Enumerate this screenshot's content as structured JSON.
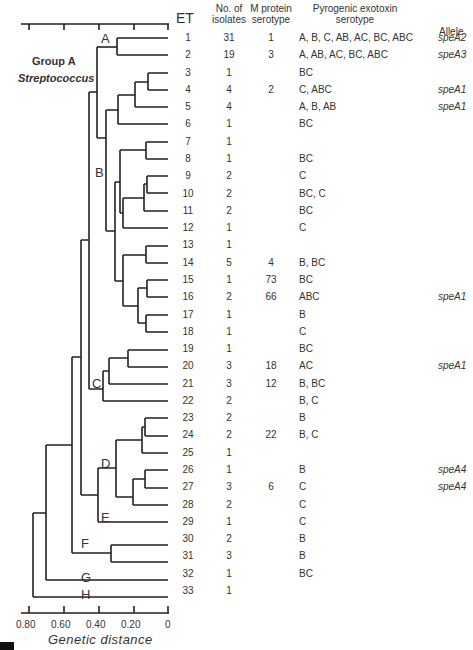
{
  "figure": {
    "title_line1": "Group  A",
    "title_line2": "Streptococcus",
    "xlabel": "Genetic  distance",
    "axis_ticks": [
      "0.80",
      "0.60",
      "0.40",
      "0.20",
      "0"
    ],
    "headers": {
      "et": "ET",
      "isolates_1": "No. of",
      "isolates_2": "isolates",
      "mprotein_1": "M protein",
      "mprotein_2": "serotype",
      "toxin_1": "Pyrogenic  exotoxin",
      "toxin_2": "serotype",
      "allele": "Allele"
    },
    "cluster_labels": [
      "A",
      "B",
      "C",
      "D",
      "E",
      "F",
      "G",
      "H"
    ]
  },
  "chart_data": {
    "type": "table",
    "xlabel": "Genetic distance",
    "axis_range": [
      0.8,
      0
    ],
    "axis_ticks": [
      0.8,
      0.6,
      0.4,
      0.2,
      0
    ],
    "columns": [
      "ET",
      "No. of isolates",
      "M protein serotype",
      "Pyrogenic exotoxin serotype",
      "Allele"
    ],
    "clusters": {
      "A": [
        1,
        2
      ],
      "B": [
        3,
        18
      ],
      "C": [
        19,
        22
      ],
      "D": [
        23,
        28
      ],
      "E": [
        29,
        29
      ],
      "F": [
        30,
        31
      ],
      "G": [
        32,
        32
      ],
      "H": [
        33,
        33
      ]
    },
    "rows": [
      {
        "et": "1",
        "isolates": "31",
        "m": "1",
        "toxin": "A, B, C, AB, AC, BC, ABC",
        "allele": "speA2"
      },
      {
        "et": "2",
        "isolates": "19",
        "m": "3",
        "toxin": "A, AB, AC, BC, ABC",
        "allele": "speA3"
      },
      {
        "et": "3",
        "isolates": "1",
        "m": "",
        "toxin": "BC",
        "allele": ""
      },
      {
        "et": "4",
        "isolates": "4",
        "m": "2",
        "toxin": "C, ABC",
        "allele": "speA1"
      },
      {
        "et": "5",
        "isolates": "4",
        "m": "",
        "toxin": "A, B, AB",
        "allele": "speA1"
      },
      {
        "et": "6",
        "isolates": "1",
        "m": "",
        "toxin": "BC",
        "allele": ""
      },
      {
        "et": "7",
        "isolates": "1",
        "m": "",
        "toxin": "",
        "allele": ""
      },
      {
        "et": "8",
        "isolates": "1",
        "m": "",
        "toxin": "BC",
        "allele": ""
      },
      {
        "et": "9",
        "isolates": "2",
        "m": "",
        "toxin": "C",
        "allele": ""
      },
      {
        "et": "10",
        "isolates": "2",
        "m": "",
        "toxin": "BC, C",
        "allele": ""
      },
      {
        "et": "11",
        "isolates": "2",
        "m": "",
        "toxin": "BC",
        "allele": ""
      },
      {
        "et": "12",
        "isolates": "1",
        "m": "",
        "toxin": "C",
        "allele": ""
      },
      {
        "et": "13",
        "isolates": "1",
        "m": "",
        "toxin": "",
        "allele": ""
      },
      {
        "et": "14",
        "isolates": "5",
        "m": "4",
        "toxin": "B, BC",
        "allele": ""
      },
      {
        "et": "15",
        "isolates": "1",
        "m": "73",
        "toxin": "BC",
        "allele": ""
      },
      {
        "et": "16",
        "isolates": "2",
        "m": "66",
        "toxin": "ABC",
        "allele": "speA1"
      },
      {
        "et": "17",
        "isolates": "1",
        "m": "",
        "toxin": "B",
        "allele": ""
      },
      {
        "et": "18",
        "isolates": "1",
        "m": "",
        "toxin": "C",
        "allele": ""
      },
      {
        "et": "19",
        "isolates": "1",
        "m": "",
        "toxin": "BC",
        "allele": ""
      },
      {
        "et": "20",
        "isolates": "3",
        "m": "18",
        "toxin": "AC",
        "allele": "speA1"
      },
      {
        "et": "21",
        "isolates": "3",
        "m": "12",
        "toxin": "B, BC",
        "allele": ""
      },
      {
        "et": "22",
        "isolates": "2",
        "m": "",
        "toxin": "B, C",
        "allele": ""
      },
      {
        "et": "23",
        "isolates": "2",
        "m": "",
        "toxin": "B",
        "allele": ""
      },
      {
        "et": "24",
        "isolates": "2",
        "m": "22",
        "toxin": "B, C",
        "allele": ""
      },
      {
        "et": "25",
        "isolates": "1",
        "m": "",
        "toxin": "",
        "allele": ""
      },
      {
        "et": "26",
        "isolates": "1",
        "m": "",
        "toxin": "B",
        "allele": "speA4"
      },
      {
        "et": "27",
        "isolates": "3",
        "m": "6",
        "toxin": "C",
        "allele": "speA4"
      },
      {
        "et": "28",
        "isolates": "2",
        "m": "",
        "toxin": "C",
        "allele": ""
      },
      {
        "et": "29",
        "isolates": "1",
        "m": "",
        "toxin": "C",
        "allele": ""
      },
      {
        "et": "30",
        "isolates": "2",
        "m": "",
        "toxin": "B",
        "allele": ""
      },
      {
        "et": "31",
        "isolates": "3",
        "m": "",
        "toxin": "B",
        "allele": ""
      },
      {
        "et": "32",
        "isolates": "1",
        "m": "",
        "toxin": "BC",
        "allele": ""
      },
      {
        "et": "33",
        "isolates": "1",
        "m": "",
        "toxin": "",
        "allele": ""
      }
    ]
  }
}
